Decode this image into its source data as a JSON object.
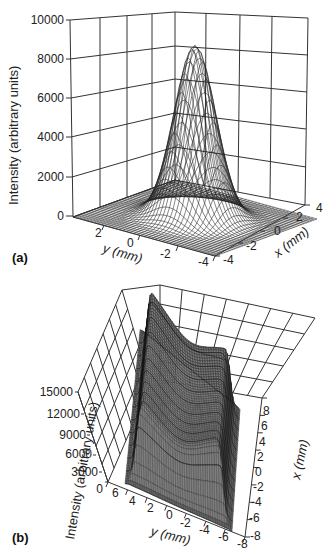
{
  "chart_data": [
    {
      "panel": "(a)",
      "type": "surface3d",
      "title": "",
      "zlabel": "Intensity (arbitrary units)",
      "ylabel": "y (mm)",
      "xlabel": "x (mm)",
      "z_ticks": [
        "0",
        "2000",
        "4000",
        "6000",
        "8000",
        "10000"
      ],
      "y_ticks": [
        "2",
        "0",
        "-2",
        "-4"
      ],
      "x_ticks": [
        "-4",
        "-2",
        "0",
        "2",
        "4"
      ],
      "zlim": [
        0,
        10000
      ],
      "ylim": [
        -4,
        4
      ],
      "xlim": [
        -4,
        4
      ],
      "description": "Single Gaussian peak centered at x=0, y=0",
      "peak": {
        "x": 0,
        "y": 0,
        "z": 8800
      },
      "grid": true
    },
    {
      "panel": "(b)",
      "type": "surface3d",
      "title": "",
      "zlabel": "Intensity (arbitrary units)",
      "ylabel": "y (mm)",
      "xlabel": "x (mm)",
      "z_ticks": [
        "0",
        "3000",
        "6000",
        "9000",
        "12000",
        "15000"
      ],
      "y_ticks": [
        "6",
        "4",
        "2",
        "0",
        "-2",
        "-4",
        "-6",
        "-8"
      ],
      "x_ticks": [
        "-8",
        "-6",
        "-4",
        "-2",
        "0",
        "2",
        "4",
        "6",
        "8"
      ],
      "zlim": [
        0,
        15000
      ],
      "ylim": [
        -8,
        6
      ],
      "xlim": [
        -8,
        8
      ],
      "description": "Flat-top beam profile with raised edges (saddle/crater shape) and a dip in the center",
      "max_z_approx": 14000,
      "grid": true
    }
  ],
  "labels": {
    "a": {
      "panel": "(a)",
      "zlabel": "Intensity (arbitrary units)",
      "ylabel": "y (mm)",
      "xlabel": "x (mm)",
      "z_ticks": [
        "10000",
        "8000",
        "6000",
        "4000",
        "2000",
        "0"
      ],
      "y_ticks": [
        "2",
        "0",
        "-2",
        "-4"
      ],
      "x_ticks": [
        "-4",
        "-2",
        "0",
        "2",
        "4"
      ]
    },
    "b": {
      "panel": "(b)",
      "zlabel": "Intensity (arbitrary units)",
      "ylabel": "y (mm)",
      "xlabel": "x (mm)",
      "z_ticks": [
        "15000",
        "12000",
        "9000",
        "6000",
        "3000",
        "0"
      ],
      "y_ticks": [
        "6",
        "4",
        "2",
        "0",
        "-2",
        "-4",
        "-6",
        "-8"
      ],
      "x_ticks": [
        "8",
        "6",
        "4",
        "2",
        "0",
        "-2",
        "-4",
        "-6",
        "-8"
      ]
    }
  }
}
